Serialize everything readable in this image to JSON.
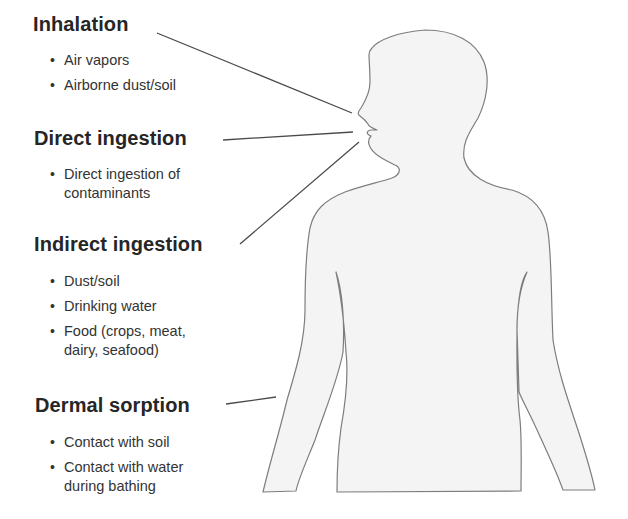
{
  "diagram": {
    "figure": "human-silhouette",
    "colors": {
      "outline": "#7a7a7a",
      "fill": "#f5f5f5",
      "leader_line": "#4a4a4a",
      "heading": "#262626",
      "text": "#333333"
    },
    "pathways": [
      {
        "heading": "Inhalation",
        "items": [
          "Air vapors",
          "Airborne dust/soil"
        ]
      },
      {
        "heading": "Direct ingestion",
        "items": [
          "Direct ingestion of contaminants"
        ],
        "items_wrapped": [
          [
            "Direct ingestion of",
            "contaminants"
          ]
        ]
      },
      {
        "heading": "Indirect ingestion",
        "items": [
          "Dust/soil",
          "Drinking water",
          "Food (crops, meat, dairy, seafood)"
        ],
        "items_wrapped": [
          [
            "Dust/soil"
          ],
          [
            "Drinking water"
          ],
          [
            "Food (crops, meat,",
            "dairy, seafood)"
          ]
        ]
      },
      {
        "heading": "Dermal sorption",
        "items": [
          "Contact with soil",
          "Contact with water during bathing"
        ],
        "items_wrapped": [
          [
            "Contact with soil"
          ],
          [
            "Contact with water",
            "during bathing"
          ]
        ]
      }
    ],
    "bullet": "•"
  }
}
